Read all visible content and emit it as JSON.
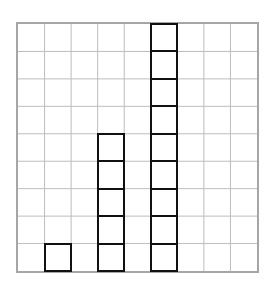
{
  "diagram": {
    "type": "unit-square-stacks",
    "grid": {
      "columns": 9,
      "rows": 9,
      "line_color": "#bdbdbd",
      "border_color": "#a6a6a6"
    },
    "stacks": [
      {
        "column": 2,
        "count": 1
      },
      {
        "column": 4,
        "count": 5
      },
      {
        "column": 6,
        "count": 9
      }
    ],
    "square_outline_color": "#111111"
  },
  "chart_data": {
    "type": "bar",
    "title": "",
    "categories": [
      "Stack 1",
      "Stack 2",
      "Stack 3"
    ],
    "values": [
      1,
      5,
      9
    ],
    "xlabel": "",
    "ylabel": "",
    "ylim": [
      0,
      9
    ],
    "grid": true,
    "legend": null
  }
}
